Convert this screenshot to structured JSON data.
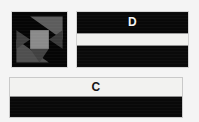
{
  "figure": {
    "background_color": "#f4f4f4",
    "width": 199,
    "height": 122
  },
  "panels": [
    {
      "id": "pinwheel",
      "label": "",
      "kind": "quilt-block-pinwheel",
      "colors": {
        "background": "#050505",
        "mid_gray": "#6d6d6d",
        "center_gray": "#8a8a8a",
        "dark_gray": "#3a3a3a",
        "border": "#d8d8d8"
      }
    },
    {
      "id": "d",
      "label": "D",
      "kind": "striped-bands",
      "label_color": "#f5f5f5",
      "bands": [
        {
          "name": "top-dark-band",
          "color": "#080808"
        },
        {
          "name": "middle-light-band",
          "color": "#f2f2f0"
        },
        {
          "name": "bottom-dark-band",
          "color": "#0a0a0a"
        }
      ]
    },
    {
      "id": "c",
      "label": "C",
      "kind": "striped-bands",
      "label_color": "#141414",
      "bands": [
        {
          "name": "top-light-band",
          "color": "#f2f2f0"
        },
        {
          "name": "bottom-dark-band",
          "color": "#090909"
        }
      ]
    }
  ],
  "labels": {
    "panel_d": "D",
    "panel_c": "C"
  }
}
